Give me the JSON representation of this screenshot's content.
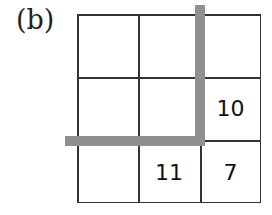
{
  "figure": {
    "label": "(b)",
    "grid": {
      "rows": 3,
      "cols": 3,
      "cells": [
        [
          "",
          "",
          ""
        ],
        [
          "",
          "",
          "10"
        ],
        [
          "",
          "11",
          "7"
        ]
      ]
    },
    "highlight_bar_color": "#8f8f8f"
  }
}
